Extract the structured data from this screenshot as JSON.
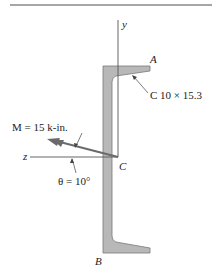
{
  "diagram": {
    "section_label": "C 10 × 15.3",
    "moment_label": "M = 15 k-in.",
    "angle_label": "θ = 10°",
    "axis_y_label": "y",
    "axis_z_label": "z",
    "point_A": "A",
    "point_B": "B",
    "point_C": "C",
    "colors": {
      "section_fill": "#b8b8b8",
      "section_stroke": "#7a7a7a",
      "line": "#555555",
      "arrow": "#6a6a6a",
      "rule": "#888888"
    }
  }
}
